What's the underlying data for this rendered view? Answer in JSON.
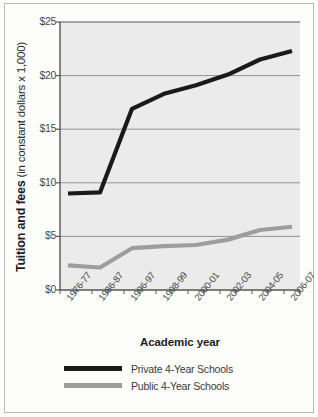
{
  "chart_data": {
    "type": "line",
    "title": "",
    "xlabel": "Academic year",
    "ylabel_bold": "Tuition and fees",
    "ylabel_regular": " (in constant dollars x 1,000)",
    "categories": [
      "1976-77",
      "1986-87",
      "1996-97",
      "1998-99",
      "2000-01",
      "2002-03",
      "2004-05",
      "2006-07"
    ],
    "x_minor_ticks": true,
    "ylim": [
      0,
      25
    ],
    "yticks": [
      0,
      5,
      10,
      15,
      20,
      25
    ],
    "ytick_labels": [
      "$0",
      "$5",
      "$10",
      "$15",
      "$20",
      "$25"
    ],
    "grid": "horizontal",
    "legend_position": "bottom",
    "series": [
      {
        "name": "Private 4-Year Schools",
        "color": "#1a1a1a",
        "values": [
          9.0,
          9.1,
          16.9,
          18.3,
          19.1,
          20.1,
          21.5,
          22.3
        ]
      },
      {
        "name": "Public 4-Year Schools",
        "color": "#9d9d9d",
        "values": [
          2.3,
          2.1,
          3.9,
          4.1,
          4.2,
          4.7,
          5.6,
          5.9
        ]
      }
    ]
  },
  "legend": {
    "items": [
      {
        "label": "Private 4-Year Schools",
        "color": "#1a1a1a"
      },
      {
        "label": "Public 4-Year Schools",
        "color": "#9d9d9d"
      }
    ]
  },
  "axes": {
    "y_title_bold": "Tuition and fees",
    "y_title_regular": " (in constant dollars x 1,000)",
    "x_title": "Academic year",
    "y_tick_0": "$0",
    "y_tick_1": "$5",
    "y_tick_2": "$10",
    "y_tick_3": "$15",
    "y_tick_4": "$20",
    "y_tick_5": "$25",
    "x_tick_0": "1976-77",
    "x_tick_1": "1986-87",
    "x_tick_2": "1996-97",
    "x_tick_3": "1998-99",
    "x_tick_4": "2000-01",
    "x_tick_5": "2002-03",
    "x_tick_6": "2004-05",
    "x_tick_7": "2006-07"
  },
  "colors": {
    "plot_background": "#ebebeb",
    "gridline": "#8a8a8a",
    "axis": "#555555",
    "private_line": "#1a1a1a",
    "public_line": "#9d9d9d",
    "frame": "#b9b9b9"
  }
}
